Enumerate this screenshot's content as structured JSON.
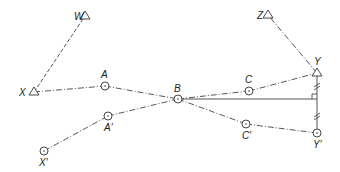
{
  "diagram": {
    "type": "survey-traverse-offset",
    "stations": [
      {
        "id": "W",
        "label": "W",
        "x": 85,
        "y": 16,
        "symbol": "triangle",
        "lx": 74,
        "ly": 20
      },
      {
        "id": "X",
        "label": "X",
        "x": 34,
        "y": 92,
        "symbol": "triangle",
        "lx": 19,
        "ly": 96
      },
      {
        "id": "Z",
        "label": "Z",
        "x": 268,
        "y": 15,
        "symbol": "triangle",
        "lx": 257,
        "ly": 19
      },
      {
        "id": "Y",
        "label": "Y",
        "x": 317,
        "y": 73,
        "symbol": "triangle",
        "lx": 314,
        "ly": 65
      },
      {
        "id": "A",
        "label": "A",
        "x": 105,
        "y": 86,
        "symbol": "circle",
        "lx": 101,
        "ly": 78
      },
      {
        "id": "B",
        "label": "B",
        "x": 178,
        "y": 99,
        "symbol": "circle",
        "lx": 174,
        "ly": 92
      },
      {
        "id": "C",
        "label": "C",
        "x": 249,
        "y": 91,
        "symbol": "circle",
        "lx": 245,
        "ly": 83
      },
      {
        "id": "A_prime",
        "label": "A′",
        "x": 108,
        "y": 116,
        "symbol": "circle",
        "lx": 104,
        "ly": 131
      },
      {
        "id": "X_prime",
        "label": "X′",
        "x": 44,
        "y": 151,
        "symbol": "circle",
        "lx": 39,
        "ly": 166
      },
      {
        "id": "C_prime",
        "label": "C′",
        "x": 246,
        "y": 124,
        "symbol": "circle",
        "lx": 242,
        "ly": 139
      },
      {
        "id": "Y_prime",
        "label": "Y′",
        "x": 317,
        "y": 133,
        "symbol": "circle",
        "lx": 313,
        "ly": 148
      }
    ],
    "lines": [
      {
        "from": "X",
        "to": "W",
        "style": "dashed"
      },
      {
        "from": "Y",
        "to": "Z",
        "style": "dashdot"
      },
      {
        "from": "X",
        "to": "A",
        "style": "dashdot"
      },
      {
        "from": "A",
        "to": "B",
        "style": "dashdot"
      },
      {
        "from": "B",
        "to": "C",
        "style": "dashdot"
      },
      {
        "from": "C",
        "to": "Y",
        "style": "dashdot"
      },
      {
        "from": "X_prime",
        "to": "A_prime",
        "style": "dashdot"
      },
      {
        "from": "A_prime",
        "to": "B",
        "style": "dashdot"
      },
      {
        "from": "B",
        "to": "C_prime",
        "style": "dashdot"
      },
      {
        "from": "C_prime",
        "to": "Y_prime",
        "style": "dashdot"
      },
      {
        "from": "Y",
        "to": "Y_prime",
        "style": "solid"
      }
    ],
    "perpendicular": {
      "from": "B",
      "foot_x": 317,
      "foot_y": 99,
      "right_angle": true
    },
    "equal_ticks": [
      {
        "x": 317,
        "y": 86
      },
      {
        "x": 317,
        "y": 116
      }
    ],
    "colors": {
      "line": "#444444",
      "text": "#222222",
      "background": "#ffffff"
    }
  }
}
